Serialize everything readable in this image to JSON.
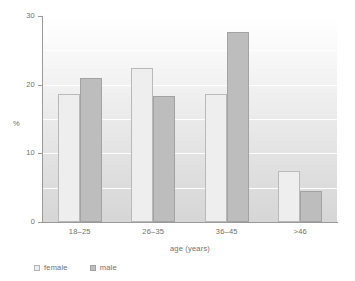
{
  "chart_data": {
    "type": "bar",
    "title": "",
    "subtitle": "",
    "categories": [
      "18–25",
      "26–35",
      "36–45",
      ">46"
    ],
    "series": [
      {
        "name": "female",
        "color": "#eeeeee",
        "values": [
          18.6,
          22.4,
          18.6,
          7.4
        ]
      },
      {
        "name": "male",
        "color": "#bdbdbd",
        "values": [
          21.0,
          18.3,
          27.7,
          4.5
        ]
      }
    ],
    "xlabel": "age (years)",
    "ylabel": "%",
    "ylim": [
      0,
      30
    ],
    "yticks": [
      0,
      10,
      20,
      30
    ],
    "ytick_labels": [
      "0",
      "10",
      "20",
      "30"
    ],
    "gridlines_at": [
      5,
      10,
      15,
      20,
      25,
      30
    ],
    "grid": true,
    "legend": {
      "position": "bottom-left",
      "entries": [
        "female",
        "male"
      ]
    },
    "annotations": []
  }
}
